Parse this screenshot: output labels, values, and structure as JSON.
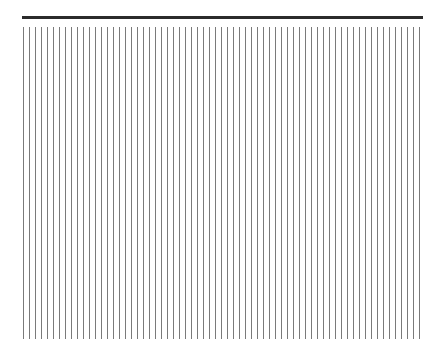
{
  "figure": {
    "top_bar": {
      "x": 22,
      "y": 16,
      "width": 401,
      "height": 3,
      "color": "#2b2b2b"
    },
    "vertical_lines": {
      "count": 67,
      "start_x": 23,
      "spacing": 6,
      "top_y": 27,
      "bottom_y": 339,
      "color": "#7a7a7a"
    }
  }
}
